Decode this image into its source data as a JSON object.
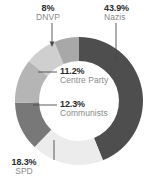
{
  "chart_data": {
    "type": "pie",
    "variant": "donut",
    "title": "",
    "subtitle": "",
    "xlabel": "",
    "ylabel": "",
    "legend_position": "none",
    "grid": false,
    "value_unit": "percent",
    "start_angle_deg": 0,
    "direction": "clockwise",
    "categories": [
      "Nazis",
      "SPD",
      "Communists",
      "Centre Party",
      "DNVP",
      "Other"
    ],
    "values": [
      43.9,
      18.3,
      12.3,
      11.2,
      8.0,
      6.3
    ],
    "labels": [
      "43.9%",
      "18.3%",
      "12.3%",
      "11.2%",
      "8%",
      ""
    ],
    "colors": [
      "#4e4e4e",
      "#ececec",
      "#787878",
      "#b5b5b5",
      "#cfcfcf",
      "#a8a8a8"
    ],
    "slices": [
      {
        "name": "Nazis",
        "value": 43.9,
        "label": "43.9%",
        "color": "#4e4e4e",
        "labeled": true
      },
      {
        "name": "SPD",
        "value": 18.3,
        "label": "18.3%",
        "color": "#ececec",
        "labeled": true
      },
      {
        "name": "Communists",
        "value": 12.3,
        "label": "12.3%",
        "color": "#787878",
        "labeled": true
      },
      {
        "name": "Centre Party",
        "value": 11.2,
        "label": "11.2%",
        "color": "#b5b5b5",
        "labeled": true
      },
      {
        "name": "DNVP",
        "value": 8.0,
        "label": "8%",
        "color": "#cfcfcf",
        "labeled": true
      },
      {
        "name": "Other",
        "value": 6.3,
        "label": "",
        "color": "#a8a8a8",
        "labeled": false
      }
    ]
  },
  "labels": {
    "dnvp": {
      "pct": "8%",
      "name": "DNVP"
    },
    "nazis": {
      "pct": "43.9%",
      "name": "Nazis"
    },
    "centre": {
      "pct": "11.2%",
      "name": "Centre Party"
    },
    "communists": {
      "pct": "12.3%",
      "name": "Communists"
    },
    "spd": {
      "pct": "18.3%",
      "name": "SPD"
    }
  },
  "style": {
    "pct_color": "#2b2b2b",
    "name_color": "#8a8a8a",
    "leader_color": "#4a4a4a",
    "background": "#ffffff"
  }
}
